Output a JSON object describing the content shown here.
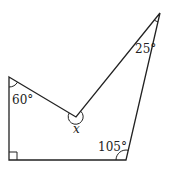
{
  "diagram": {
    "type": "concave pentagon",
    "vertices": {
      "top_left": [
        9,
        77
      ],
      "reflex": [
        76,
        117
      ],
      "top_right": [
        160,
        13
      ],
      "bottom_right": [
        126,
        160
      ],
      "bottom_left": [
        9,
        160
      ]
    },
    "labels": {
      "angle_top_left": "60°",
      "angle_top_right": "25°",
      "angle_bottom_right": "105°",
      "angle_reflex": "x"
    },
    "marks": {
      "bottom_left": "right-angle"
    },
    "stroke_color": "#222222"
  }
}
